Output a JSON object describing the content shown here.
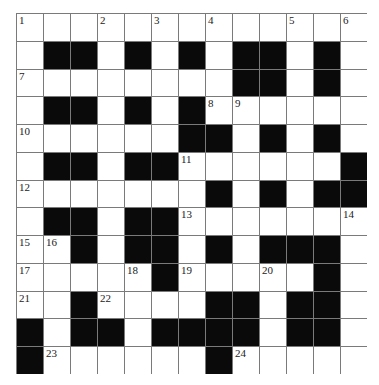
{
  "puzzle": {
    "rows": 13,
    "cols": 13,
    "colors": {
      "block": "#0a0a0a",
      "cell": "#ffffff",
      "line": "#7a7a7a",
      "number": "#222222"
    },
    "layout": [
      "WWWWWWWWWWWWW",
      "WBBWBWBWBBWBW",
      "WWWWWWWWBBWBW",
      "WBBWBWBWWWWWW",
      "WWWWWWBBWBWBW",
      "WBBWBBWWWWWWB",
      "WWWWWWWBWBWBB",
      "WBBWBBWWWWWWW",
      "WWBWBBWBWBBBW",
      "WWWWWBWWWWWBW",
      "WWBWWWWBBWBBW",
      "BWBBWBBBBWBBW",
      "BWWWWWWBWWWWW"
    ],
    "numbers": [
      {
        "r": 0,
        "c": 0,
        "n": "1"
      },
      {
        "r": 0,
        "c": 3,
        "n": "2"
      },
      {
        "r": 0,
        "c": 5,
        "n": "3"
      },
      {
        "r": 0,
        "c": 7,
        "n": "4"
      },
      {
        "r": 0,
        "c": 10,
        "n": "5"
      },
      {
        "r": 0,
        "c": 12,
        "n": "6"
      },
      {
        "r": 2,
        "c": 0,
        "n": "7"
      },
      {
        "r": 3,
        "c": 7,
        "n": "8"
      },
      {
        "r": 3,
        "c": 8,
        "n": "9"
      },
      {
        "r": 4,
        "c": 0,
        "n": "10"
      },
      {
        "r": 5,
        "c": 6,
        "n": "11"
      },
      {
        "r": 6,
        "c": 0,
        "n": "12"
      },
      {
        "r": 7,
        "c": 6,
        "n": "13"
      },
      {
        "r": 7,
        "c": 12,
        "n": "14"
      },
      {
        "r": 8,
        "c": 0,
        "n": "15"
      },
      {
        "r": 8,
        "c": 1,
        "n": "16"
      },
      {
        "r": 9,
        "c": 0,
        "n": "17"
      },
      {
        "r": 9,
        "c": 4,
        "n": "18"
      },
      {
        "r": 9,
        "c": 6,
        "n": "19"
      },
      {
        "r": 9,
        "c": 9,
        "n": "20"
      },
      {
        "r": 10,
        "c": 0,
        "n": "21"
      },
      {
        "r": 10,
        "c": 3,
        "n": "22"
      },
      {
        "r": 12,
        "c": 1,
        "n": "23"
      },
      {
        "r": 12,
        "c": 8,
        "n": "24"
      }
    ]
  }
}
